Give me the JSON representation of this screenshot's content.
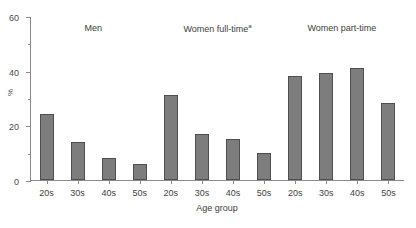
{
  "clipped_top_text": "· · · · ·",
  "chart_data": {
    "type": "bar",
    "title": "",
    "xlabel": "Age group",
    "ylabel": "%",
    "ylim": [
      0,
      60
    ],
    "yticks": [
      0,
      20,
      40,
      60
    ],
    "yticks_minor": [
      10,
      30,
      50
    ],
    "grid": false,
    "legend": "none",
    "categories": [
      "20s",
      "30s",
      "40s",
      "50s"
    ],
    "groups": [
      {
        "name": "Men",
        "label": "Men",
        "superscript": "",
        "categories": [
          "20s",
          "30s",
          "40s",
          "50s"
        ],
        "values": [
          24,
          14,
          8,
          6
        ]
      },
      {
        "name": "Women full-time",
        "label": "Women full-time",
        "superscript": "a",
        "categories": [
          "20s",
          "30s",
          "40s",
          "50s"
        ],
        "values": [
          31,
          17,
          15,
          10
        ]
      },
      {
        "name": "Women part-time",
        "label": "Women part-time",
        "superscript": "",
        "categories": [
          "20s",
          "30s",
          "40s",
          "50s"
        ],
        "values": [
          38,
          39,
          41,
          28
        ]
      }
    ],
    "bar_color": "#7d7d7d",
    "bar_border_color": "#4f4f4f",
    "axis_color": "#8a8a8a",
    "text_color": "#404040"
  }
}
